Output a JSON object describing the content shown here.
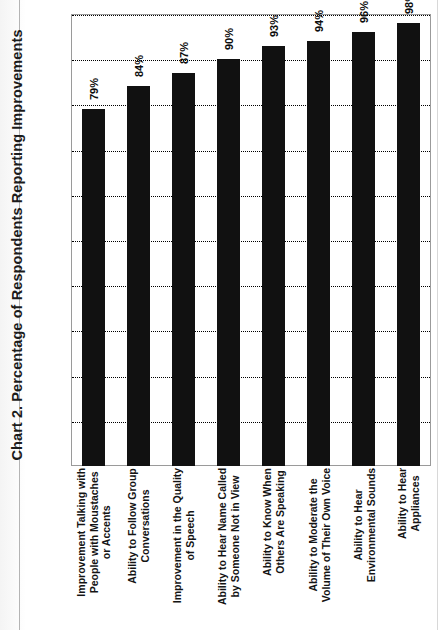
{
  "document": {
    "page_background": "#fdfdfd",
    "ink_color": "#111111"
  },
  "chart_data": {
    "type": "bar",
    "title": "Chart 2. Percentage of Respondents Reporting Improvements",
    "xlabel": "",
    "ylabel": "",
    "ylim": [
      0,
      100
    ],
    "grid": true,
    "gridline_interval": 10,
    "gridline_values": [
      10,
      20,
      30,
      40,
      50,
      60,
      70,
      80,
      90,
      100
    ],
    "legend": false,
    "orientation": "vertical-bars-rotated-90",
    "bar_color": "#111111",
    "categories": [
      "Improvement Talking with People with Moustaches or Accents",
      "Ability to Follow Group Conversations",
      "Improvement in the Quality of Speech",
      "Ability to Hear Name Called by Someone Not in View",
      "Ability to Know When Others Are Speaking",
      "Ability to Moderate the Volume of Their Own Voice",
      "Ability to Hear Environmental Sounds",
      "Ability to Hear Appliances"
    ],
    "category_lines": [
      [
        "Improvement Talking with",
        "People with Moustaches",
        "or Accents"
      ],
      [
        "Ability to Follow Group",
        "Conversations"
      ],
      [
        "Improvement in the Quality",
        "of Speech"
      ],
      [
        "Ability to Hear Name Called",
        "by Someone Not in View"
      ],
      [
        "Ability to Know When",
        "Others Are Speaking"
      ],
      [
        "Ability to Moderate the",
        "Volume of Their Own Voice"
      ],
      [
        "Ability to Hear",
        "Environmental Sounds"
      ],
      [
        "Ability to Hear",
        "Appliances"
      ]
    ],
    "values": [
      79,
      84,
      87,
      90,
      93,
      94,
      96,
      98
    ],
    "value_labels": [
      "79%",
      "84%",
      "87%",
      "90%",
      "93%",
      "94%",
      "96%",
      "98%"
    ]
  }
}
